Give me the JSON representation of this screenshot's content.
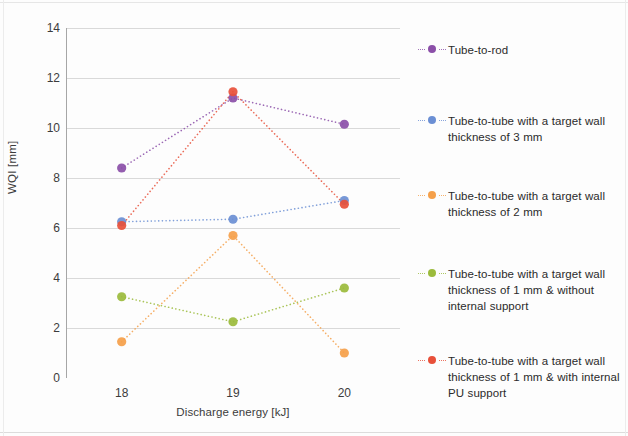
{
  "chart_data": {
    "type": "line",
    "title": "",
    "subtitle": "",
    "xlabel": "Discharge energy [kJ]",
    "ylabel": "WQI [mm]",
    "categories": [
      "18",
      "19",
      "20"
    ],
    "x": [
      18,
      19,
      20
    ],
    "xlim": [
      17.5,
      20.5
    ],
    "ylim": [
      0,
      14
    ],
    "ytick_labels": [
      "0",
      "2",
      "4",
      "6",
      "8",
      "10",
      "12",
      "14"
    ],
    "ytick_values": [
      0,
      2,
      4,
      6,
      8,
      10,
      12,
      14
    ],
    "xtick_labels": [
      "18",
      "19",
      "20"
    ],
    "grid": "horizontal",
    "legend_position": "right",
    "line_style": "dotted",
    "marker": "circle",
    "series": [
      {
        "name": "Tube-to-rod",
        "color": "#8B4FA8",
        "values": [
          8.4,
          11.2,
          10.15
        ]
      },
      {
        "name": "Tube-to-tube with a target wall thickness of 3 mm",
        "color": "#6B8FD4",
        "values": [
          6.25,
          6.35,
          7.1
        ]
      },
      {
        "name": "Tube-to-tube with a target wall thickness of 2 mm",
        "color": "#F5A04A",
        "values": [
          1.45,
          5.7,
          1.0
        ]
      },
      {
        "name": "Tube-to-tube with a target wall thickness of 1 mm & without internal support",
        "color": "#9BBB3C",
        "values": [
          3.25,
          2.25,
          3.6
        ]
      },
      {
        "name": "Tube-to-tube with a target wall thickness of 1 mm & with internal PU support",
        "color": "#E8503A",
        "values": [
          6.1,
          11.45,
          6.95
        ]
      }
    ]
  },
  "legend": {
    "items": [
      {
        "label": "Tube-to-rod",
        "color": "#8B4FA8",
        "top": 26,
        "lines": 1
      },
      {
        "label": "Tube-to-tube with a target wall thickness of 3 mm",
        "color": "#6B8FD4",
        "top": 97,
        "lines": 2
      },
      {
        "label": "Tube-to-tube with a target wall thickness of 2 mm",
        "color": "#F5A04A",
        "top": 172,
        "lines": 2
      },
      {
        "label": "Tube-to-tube with a target wall thickness of 1 mm & without internal support",
        "color": "#9BBB3C",
        "top": 250,
        "lines": 3
      },
      {
        "label": "Tube-to-tube with a target wall thickness of 1 mm & with internal PU support",
        "color": "#E8503A",
        "top": 337,
        "lines": 3
      }
    ]
  },
  "axes": {
    "y_title": "WQI [mm]",
    "x_title": "Discharge energy [kJ]"
  },
  "colors": {
    "grid": "#d9d9d9",
    "axis": "#a6a6a6",
    "text": "#3c3c3c",
    "background": "#ffffff"
  }
}
